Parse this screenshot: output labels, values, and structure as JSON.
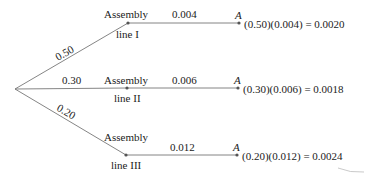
{
  "diagram": {
    "type": "probability-tree",
    "root": {
      "x": 15,
      "y": 89
    },
    "branches": [
      {
        "probability": "0.50",
        "node_label_top": "Assembly",
        "node_label_bottom": "line I",
        "conditional": "0.004",
        "outcome": "A",
        "product": "(0.50)(0.004) = 0.0020"
      },
      {
        "probability": "0.30",
        "node_label_top": "Assembly",
        "node_label_bottom": "line II",
        "conditional": "0.006",
        "outcome": "A",
        "product": "(0.30)(0.006) = 0.0018"
      },
      {
        "probability": "0.20",
        "node_label_top": "Assembly",
        "node_label_bottom": "line III",
        "conditional": "0.012",
        "outcome": "A",
        "product": "(0.20)(0.012) = 0.0024"
      }
    ],
    "colors": {
      "line": "#777777",
      "text": "#222222",
      "node": "#555555"
    }
  }
}
